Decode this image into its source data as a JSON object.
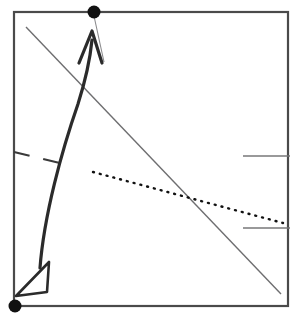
{
  "figure": {
    "canvas": {
      "width": 297,
      "height": 329
    },
    "background_color": "#ffffff"
  },
  "frame": {
    "name": "plot-frame",
    "x": 14,
    "y": 12,
    "width": 274,
    "height": 294,
    "stroke_color": "#4a4a4a",
    "stroke_width": 2.2
  },
  "markers": [
    {
      "name": "top-marker-dot",
      "label": "filled dot on top border",
      "cx": 94,
      "cy": 12,
      "r": 6.5,
      "color": "#111111"
    },
    {
      "name": "bottom-left-marker-dot",
      "label": "filled dot at bottom-left corner",
      "cx": 15,
      "cy": 306,
      "r": 6.5,
      "color": "#111111"
    }
  ],
  "curve": {
    "name": "thick-curved-arrow",
    "label": "bold S-curve rising from lower-left to upper area",
    "path": "M 40 268 C 44 215 62 150 78 104 C 85 82 90 60 92 40",
    "stroke_color": "#2b2b2b",
    "stroke_width": 3.2,
    "arrow_up": {
      "name": "up-arrowhead",
      "apex_x": 92,
      "apex_y": 31,
      "left_x": 79,
      "left_y": 63,
      "right_x": 102,
      "right_y": 63,
      "style": "open-v"
    },
    "arrow_down": {
      "name": "down-left-arrowhead",
      "label": "hollow triangular arrowhead pointing down-left",
      "points": "16 296 49 262 47 292",
      "fill": "none",
      "stroke_color": "#2b2b2b",
      "stroke_width": 2.6
    }
  },
  "lines": [
    {
      "name": "diagonal-trend-line",
      "label": "thin solid descending diagonal",
      "x1": 26,
      "y1": 27,
      "x2": 281,
      "y2": 294,
      "stroke_color": "#6e6e70",
      "stroke_width": 1.4,
      "dash": "none"
    },
    {
      "name": "dashed-trend-line",
      "label": "short dashed segment on left",
      "x1": 14,
      "y1": 152,
      "x2": 72,
      "y2": 166,
      "stroke_color": "#3a3a3a",
      "stroke_width": 2.2,
      "dash": "16 14"
    },
    {
      "name": "dotted-trend-line",
      "label": "dotted gently descending line",
      "x1": 93,
      "y1": 172,
      "x2": 283,
      "y2": 223,
      "stroke_color": "#111111",
      "stroke_width": 2.4,
      "dash": "1 6"
    },
    {
      "name": "right-upper-tick-line",
      "label": "short horizontal segment near right edge, upper",
      "x1": 243,
      "y1": 156,
      "x2": 290,
      "y2": 156,
      "stroke_color": "#777779",
      "stroke_width": 1.6,
      "dash": "none"
    },
    {
      "name": "right-lower-tick-line",
      "label": "short horizontal segment near right edge, lower",
      "x1": 243,
      "y1": 228,
      "x2": 290,
      "y2": 228,
      "stroke_color": "#777779",
      "stroke_width": 1.6,
      "dash": "none"
    },
    {
      "name": "marker-leader-line",
      "label": "thin leader from top dot down past arrowhead",
      "x1": 94,
      "y1": 16,
      "x2": 104,
      "y2": 62,
      "stroke_color": "#8a8a8c",
      "stroke_width": 1.1,
      "dash": "none"
    }
  ]
}
